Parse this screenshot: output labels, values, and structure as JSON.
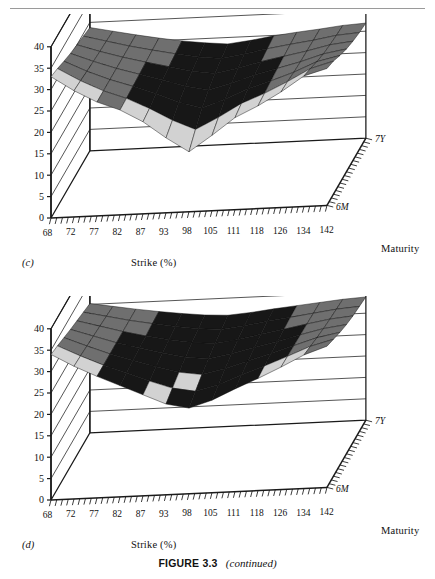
{
  "figure": {
    "caption_bold": "FIGURE 3.3",
    "caption_italic": "(continued)",
    "rule": true
  },
  "panels": [
    {
      "id": "c",
      "label": "(c)",
      "xlabel": "Strike (%)",
      "zlabel": "Maturity",
      "ylabel": "",
      "yticks": [
        "0",
        "5",
        "10",
        "15",
        "20",
        "25",
        "30",
        "35",
        "40"
      ],
      "xticks": [
        "68",
        "72",
        "77",
        "82",
        "87",
        "93",
        "98",
        "105",
        "111",
        "118",
        "126",
        "134",
        "142"
      ],
      "zticks": [
        "7Y",
        "6M"
      ]
    },
    {
      "id": "d",
      "label": "(d)",
      "xlabel": "Strike (%)",
      "zlabel": "Maturity",
      "ylabel": "",
      "yticks": [
        "0",
        "5",
        "10",
        "15",
        "20",
        "25",
        "30",
        "35",
        "40"
      ],
      "xticks": [
        "68",
        "72",
        "77",
        "82",
        "87",
        "93",
        "98",
        "105",
        "111",
        "118",
        "126",
        "134",
        "142"
      ],
      "zticks": [
        "7Y",
        "6M"
      ]
    }
  ],
  "colors": {
    "axis": "#1a1a1a",
    "grid": "#2b2b2b",
    "surface_dark": "#171717",
    "surface_mid": "#6f6f6f",
    "surface_light": "#d2d2d2",
    "mesh": "#0d0d0d",
    "background": "#ffffff"
  },
  "chart_data": [
    {
      "type": "surface",
      "panel": "c",
      "title": "",
      "xlabel": "Strike (%)",
      "ylabel": "Implied volatility (%)",
      "zlabel": "Maturity",
      "ylim": [
        0,
        40
      ],
      "grid": true,
      "legend": "none",
      "x": [
        68,
        72,
        77,
        82,
        87,
        93,
        98,
        105,
        111,
        118,
        126,
        134,
        142
      ],
      "z": [
        "6M",
        "1Y",
        "2Y",
        "3Y",
        "4Y",
        "5Y",
        "7Y"
      ],
      "series": [
        {
          "name": "6M",
          "values": [
            33.0,
            29.5,
            26.6,
            24.5,
            21.5,
            17.5,
            14.0,
            17.6,
            21.5,
            24.0,
            27.0,
            30.5,
            32.0
          ]
        },
        {
          "name": "1Y",
          "values": [
            32.3,
            29.2,
            26.6,
            24.6,
            22.0,
            19.0,
            16.6,
            19.2,
            22.2,
            24.3,
            26.8,
            29.6,
            31.1
          ]
        },
        {
          "name": "2Y",
          "values": [
            31.4,
            28.8,
            26.6,
            24.8,
            22.8,
            20.6,
            19.0,
            20.8,
            23.0,
            24.6,
            26.4,
            28.6,
            29.8
          ]
        },
        {
          "name": "3Y",
          "values": [
            30.6,
            28.5,
            26.6,
            25.0,
            23.4,
            21.7,
            20.6,
            21.9,
            23.6,
            24.9,
            26.2,
            27.8,
            28.7
          ]
        },
        {
          "name": "4Y",
          "values": [
            30.0,
            28.2,
            26.6,
            25.2,
            23.9,
            22.6,
            21.8,
            22.8,
            24.1,
            25.1,
            26.1,
            27.3,
            27.9
          ]
        },
        {
          "name": "5Y",
          "values": [
            29.4,
            28.0,
            26.6,
            25.4,
            24.3,
            23.3,
            22.7,
            23.5,
            24.5,
            25.3,
            26.0,
            26.9,
            27.3
          ]
        },
        {
          "name": "7Y",
          "values": [
            28.8,
            27.7,
            26.6,
            25.6,
            24.7,
            24.0,
            23.5,
            24.1,
            24.9,
            25.5,
            26.0,
            26.6,
            26.9
          ]
        }
      ]
    },
    {
      "type": "surface",
      "panel": "d",
      "title": "",
      "xlabel": "Strike (%)",
      "ylabel": "Implied volatility (%)",
      "zlabel": "Maturity",
      "ylim": [
        0,
        40
      ],
      "grid": true,
      "legend": "none",
      "x": [
        68,
        72,
        77,
        82,
        87,
        93,
        98,
        105,
        111,
        118,
        126,
        134,
        142
      ],
      "z": [
        "6M",
        "1Y",
        "2Y",
        "3Y",
        "4Y",
        "5Y",
        "7Y"
      ],
      "series": [
        {
          "name": "6M",
          "values": [
            34.0,
            31.0,
            28.4,
            26.0,
            23.6,
            21.2,
            20.0,
            21.6,
            24.0,
            26.2,
            28.6,
            31.2,
            33.0
          ]
        },
        {
          "name": "1Y",
          "values": [
            33.4,
            30.8,
            28.4,
            26.3,
            24.2,
            22.3,
            21.3,
            22.6,
            24.6,
            26.5,
            28.5,
            30.6,
            32.0
          ]
        },
        {
          "name": "2Y",
          "values": [
            32.7,
            30.5,
            28.4,
            26.6,
            24.9,
            23.4,
            22.6,
            23.7,
            25.3,
            26.8,
            28.4,
            30.0,
            31.0
          ]
        },
        {
          "name": "3Y",
          "values": [
            32.0,
            30.2,
            28.4,
            26.9,
            25.5,
            24.3,
            23.7,
            24.6,
            25.8,
            27.0,
            28.3,
            29.5,
            30.2
          ]
        },
        {
          "name": "4Y",
          "values": [
            31.4,
            29.9,
            28.4,
            27.1,
            26.0,
            25.1,
            24.6,
            25.3,
            26.3,
            27.2,
            28.2,
            29.1,
            29.6
          ]
        },
        {
          "name": "5Y",
          "values": [
            30.8,
            29.6,
            28.4,
            27.4,
            26.5,
            25.7,
            25.3,
            25.9,
            26.7,
            27.4,
            28.1,
            28.8,
            29.2
          ]
        },
        {
          "name": "7Y",
          "values": [
            30.2,
            29.3,
            28.4,
            27.6,
            26.9,
            26.3,
            26.0,
            26.4,
            27.0,
            27.5,
            28.0,
            28.5,
            28.8
          ]
        }
      ]
    }
  ]
}
